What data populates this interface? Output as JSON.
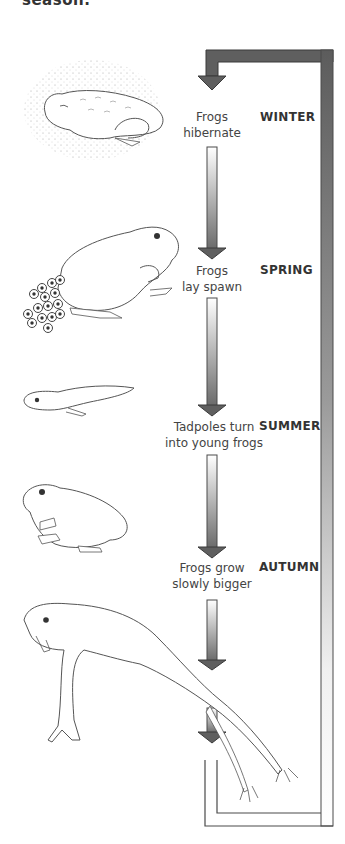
{
  "diagram": {
    "title_fragment": "season.",
    "type": "life-cycle",
    "stages": [
      {
        "season": "WINTER",
        "text_line1": "Frogs",
        "text_line2": "hibernate",
        "illustration": "hibernating-frog"
      },
      {
        "season": "SPRING",
        "text_line1": "Frogs",
        "text_line2": "lay spawn",
        "illustration": "frog-with-spawn"
      },
      {
        "season": "SUMMER",
        "text_line1": "Tadpoles turn",
        "text_line2": "into young frogs",
        "illustration": "tadpole"
      },
      {
        "season": "AUTUMN",
        "text_line1": "Frogs grow",
        "text_line2": "slowly bigger",
        "illustration": "young-frog"
      }
    ],
    "final_illustration": "adult-frog-leaping",
    "colors": {
      "arrow_dark": "#5f5f5f",
      "arrow_light": "#ffffff",
      "outline": "#4a4a4a",
      "text": "#444444"
    }
  }
}
